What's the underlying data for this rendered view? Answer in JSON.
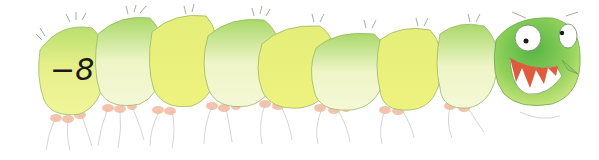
{
  "illustration": {
    "subject": "caterpillar",
    "segment_label": "−8",
    "segment_count": 8,
    "colors": {
      "body_yellow": "#eaf07a",
      "body_light": "#f3f7c4",
      "body_green": "#b9df6e",
      "head_green": "#6cc04a",
      "head_light": "#cde77a",
      "mouth_red": "#e05a3c",
      "feet_pink": "#f2b9a0",
      "outline": "#9bb86a"
    }
  }
}
